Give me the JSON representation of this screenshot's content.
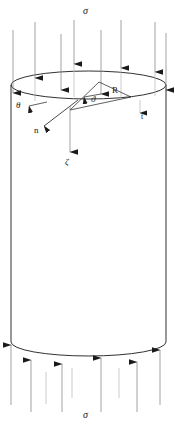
{
  "figure": {
    "colors": {
      "stroke": "#1a1a1a",
      "arrow_shaft": "#8a8a8a",
      "thin_shaft": "#b4b4b4",
      "background": "#ffffff"
    },
    "geometry": {
      "cylinder_left_x": 11,
      "cylinder_right_x": 166,
      "top_ellipse_center_y": 85,
      "top_ellipse_rx": 77.5,
      "top_ellipse_ry": 14,
      "bottom_ellipse_center_y": 342,
      "bottom_ellipse_rx": 77.5,
      "bottom_ellipse_ry": 14,
      "vector_origin_x": 70,
      "vector_origin_y": 110
    }
  },
  "labels": {
    "sigma_top": "σ",
    "sigma_bottom": "σ",
    "radius": "R",
    "theta_left": "θ",
    "theta_inner": "ϑ",
    "normal": "n",
    "zeta": "ζ",
    "tick_right": "t"
  },
  "load_arrows": {
    "top_label": "σ",
    "top_direction": "down",
    "bottom_label": "σ",
    "bottom_direction": "up",
    "top_count": 12,
    "bottom_count": 10
  },
  "annotations": [
    {
      "name": "radius-label",
      "text": "R",
      "x": 113,
      "y": 88
    },
    {
      "name": "theta-left-label",
      "text": "θ",
      "x": 17,
      "y": 105
    },
    {
      "name": "theta-inner-label",
      "text": "ϑ",
      "x": 93,
      "y": 99
    },
    {
      "name": "normal-label",
      "text": "n",
      "x": 35,
      "y": 130
    },
    {
      "name": "zeta-label",
      "text": "ζ",
      "x": 66,
      "y": 164
    },
    {
      "name": "tick-right-label",
      "text": "t",
      "x": 142,
      "y": 116
    },
    {
      "name": "sigma-top-label",
      "text": "σ",
      "x": 83,
      "y": 8
    },
    {
      "name": "sigma-bottom-label",
      "text": "σ",
      "x": 83,
      "y": 412
    }
  ]
}
